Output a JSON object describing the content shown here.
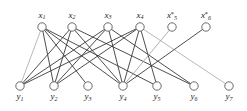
{
  "figure": {
    "kind": "bipartite-graph",
    "background_color": "#ffffff",
    "width": 247,
    "height": 111,
    "node_fill": "#ffffff",
    "node_stroke": "#5a5a5a",
    "edge_color_dark": "#3a3a3a",
    "edge_color_light": "#9a9a9a"
  },
  "chart_data": {
    "type": "diagram",
    "title": "",
    "xlabel": "",
    "ylabel": "",
    "top_row_label": "x",
    "bottom_row_label": "y",
    "nodes_top": [
      {
        "id": "x1",
        "base": "x",
        "sub": "1",
        "star": "",
        "label": "x1",
        "cx": 42,
        "cy": 27,
        "r": 4.2
      },
      {
        "id": "x2",
        "base": "x",
        "sub": "2",
        "star": "",
        "label": "x2",
        "cx": 72,
        "cy": 27,
        "r": 4.2
      },
      {
        "id": "x3",
        "base": "x",
        "sub": "3",
        "star": "",
        "label": "x3",
        "cx": 108,
        "cy": 27,
        "r": 4.2
      },
      {
        "id": "x4",
        "base": "x",
        "sub": "4",
        "star": "",
        "label": "x4",
        "cx": 140,
        "cy": 27,
        "r": 4.2
      },
      {
        "id": "x5",
        "base": "x",
        "sub": "5",
        "star": "*",
        "label": "x5*",
        "cx": 172,
        "cy": 27,
        "r": 4.2
      },
      {
        "id": "x6",
        "base": "x",
        "sub": "6",
        "star": "*",
        "label": "x6*",
        "cx": 206,
        "cy": 27,
        "r": 4.2
      }
    ],
    "nodes_bottom": [
      {
        "id": "y1",
        "base": "y",
        "sub": "1",
        "star": "",
        "label": "y1",
        "cx": 20,
        "cy": 86,
        "r": 4.2
      },
      {
        "id": "y2",
        "base": "y",
        "sub": "2",
        "star": "",
        "label": "y2",
        "cx": 54,
        "cy": 86,
        "r": 4.2
      },
      {
        "id": "y3",
        "base": "y",
        "sub": "3",
        "star": "",
        "label": "y3",
        "cx": 88,
        "cy": 86,
        "r": 4.2
      },
      {
        "id": "y4",
        "base": "y",
        "sub": "4",
        "star": "",
        "label": "y4",
        "cx": 123,
        "cy": 86,
        "r": 4.2
      },
      {
        "id": "y5",
        "base": "y",
        "sub": "5",
        "star": "",
        "label": "y5",
        "cx": 157,
        "cy": 86,
        "r": 4.2
      },
      {
        "id": "y6",
        "base": "y",
        "sub": "6",
        "star": "",
        "label": "y6",
        "cx": 194,
        "cy": 86,
        "r": 4.2
      },
      {
        "id": "y7",
        "base": "y",
        "sub": "7",
        "star": "",
        "label": "y7",
        "cx": 229,
        "cy": 86,
        "r": 4.2
      }
    ],
    "edges": [
      {
        "from": "x1",
        "to": "y1",
        "shade": "light",
        "width": 0.7
      },
      {
        "from": "x1",
        "to": "y2",
        "shade": "dark",
        "width": 0.9
      },
      {
        "from": "x1",
        "to": "y3",
        "shade": "dark",
        "width": 0.9
      },
      {
        "from": "x1",
        "to": "y4",
        "shade": "dark",
        "width": 0.9
      },
      {
        "from": "x1",
        "to": "y5",
        "shade": "dark",
        "width": 0.9
      },
      {
        "from": "x2",
        "to": "y1",
        "shade": "dark",
        "width": 0.9
      },
      {
        "from": "x2",
        "to": "y2",
        "shade": "dark",
        "width": 0.9
      },
      {
        "from": "x2",
        "to": "y4",
        "shade": "dark",
        "width": 0.9
      },
      {
        "from": "x2",
        "to": "y6",
        "shade": "dark",
        "width": 0.9
      },
      {
        "from": "x3",
        "to": "y1",
        "shade": "dark",
        "width": 0.9
      },
      {
        "from": "x3",
        "to": "y2",
        "shade": "dark",
        "width": 0.9
      },
      {
        "from": "x3",
        "to": "y4",
        "shade": "dark",
        "width": 0.9
      },
      {
        "from": "x3",
        "to": "y6",
        "shade": "dark",
        "width": 0.9
      },
      {
        "from": "x4",
        "to": "y1",
        "shade": "dark",
        "width": 0.9
      },
      {
        "from": "x4",
        "to": "y2",
        "shade": "dark",
        "width": 0.9
      },
      {
        "from": "x4",
        "to": "y4",
        "shade": "dark",
        "width": 0.9
      },
      {
        "from": "x4",
        "to": "y5",
        "shade": "dark",
        "width": 0.9
      },
      {
        "from": "x4",
        "to": "y7",
        "shade": "light",
        "width": 0.7
      },
      {
        "from": "x5",
        "to": "y4",
        "shade": "light",
        "width": 0.8
      },
      {
        "from": "x6",
        "to": "y4",
        "shade": "dark",
        "width": 0.9
      }
    ]
  }
}
